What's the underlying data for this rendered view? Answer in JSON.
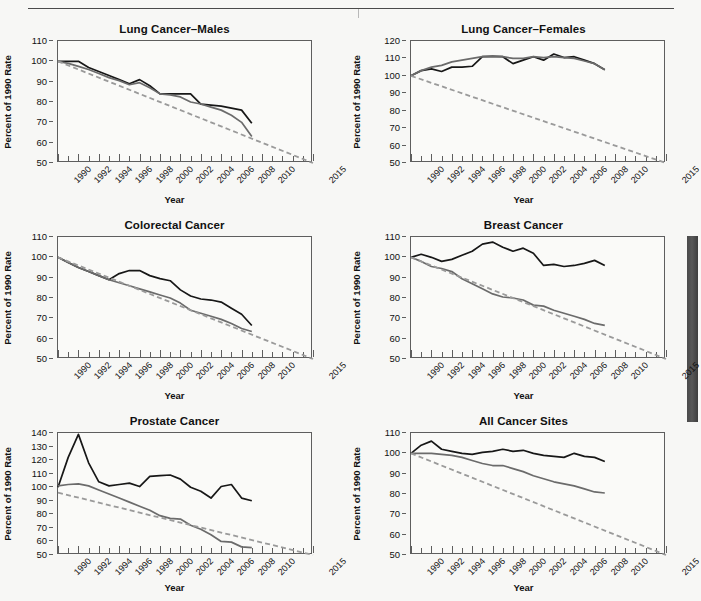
{
  "figure": {
    "axis_titles": {
      "x": "Year",
      "y": "Percent of 1990 Rate"
    },
    "xtick_labels": [
      "1990",
      "1992",
      "1994",
      "1996",
      "1998",
      "2000",
      "2002",
      "2004",
      "2006",
      "2008",
      "2010",
      "2015"
    ],
    "colors": {
      "observed_black": "#171717",
      "observed_gray": "#6b6b6b",
      "target_dashed": "#9a9a9a",
      "axis": "#5e5e5e",
      "page_background": "#f7f7f5"
    },
    "legend_note": ""
  },
  "chart_data": [
    {
      "type": "line",
      "title": "Lung Cancer–Males",
      "xlabel": "Year",
      "ylabel": "Percent of 1990 Rate",
      "xlim": [
        1990,
        2015
      ],
      "ylim": [
        50,
        110
      ],
      "yticks": [
        50,
        60,
        70,
        80,
        90,
        100,
        110
      ],
      "xticks": [
        1990,
        1992,
        1994,
        1996,
        1998,
        2000,
        2002,
        2004,
        2006,
        2008,
        2010,
        2015
      ],
      "grid": false,
      "legend_position": "none",
      "series": [
        {
          "name": "Incidence (black solid)",
          "x": [
            1990,
            1991,
            1992,
            1993,
            1994,
            1995,
            1996,
            1997,
            1998,
            1999,
            2000,
            2001,
            2002,
            2003,
            2004,
            2005,
            2006,
            2007,
            2008,
            2009
          ],
          "values": [
            100,
            100,
            100,
            97,
            95,
            93,
            91,
            89,
            91,
            88,
            84,
            84,
            84,
            84,
            79,
            78.5,
            78,
            77,
            76,
            69.5
          ]
        },
        {
          "name": "Mortality (gray solid)",
          "x": [
            1990,
            1991,
            1992,
            1993,
            1994,
            1995,
            1996,
            1997,
            1998,
            1999,
            2000,
            2001,
            2002,
            2003,
            2004,
            2005,
            2006,
            2007,
            2008,
            2009
          ],
          "values": [
            100,
            99,
            97.5,
            96,
            94,
            92,
            90.5,
            88.5,
            89.5,
            87,
            84,
            83.5,
            82.5,
            80,
            79,
            77.5,
            76,
            73.5,
            70,
            63
          ]
        },
        {
          "name": "Target trend (gray dashed)",
          "x": [
            1990,
            2015
          ],
          "values": [
            100,
            50
          ]
        }
      ]
    },
    {
      "type": "line",
      "title": "Lung Cancer–Females",
      "xlabel": "Year",
      "ylabel": "Percent of 1990 Rate",
      "xlim": [
        1990,
        2015
      ],
      "ylim": [
        50,
        120
      ],
      "yticks": [
        50,
        60,
        70,
        80,
        90,
        100,
        110,
        120
      ],
      "xticks": [
        1990,
        1992,
        1994,
        1996,
        1998,
        2000,
        2002,
        2004,
        2006,
        2008,
        2010,
        2015
      ],
      "grid": false,
      "legend_position": "none",
      "series": [
        {
          "name": "Incidence (black solid)",
          "x": [
            1990,
            1991,
            1992,
            1993,
            1994,
            1995,
            1996,
            1997,
            1998,
            1999,
            2000,
            2001,
            2002,
            2003,
            2004,
            2005,
            2006,
            2007,
            2008,
            2009
          ],
          "values": [
            100,
            103,
            104,
            102.5,
            105,
            105,
            105.5,
            111,
            111,
            111,
            107,
            109,
            111,
            109,
            112.5,
            110.5,
            111,
            109,
            107,
            103.5
          ]
        },
        {
          "name": "Mortality (gray solid)",
          "x": [
            1990,
            1991,
            1992,
            1993,
            1994,
            1995,
            1996,
            1997,
            1998,
            1999,
            2000,
            2001,
            2002,
            2003,
            2004,
            2005,
            2006,
            2007,
            2008,
            2009
          ],
          "values": [
            100,
            103,
            105,
            106,
            108,
            109,
            110,
            111,
            111.5,
            111,
            110,
            110,
            111,
            110.5,
            111,
            110.5,
            110,
            108.5,
            107,
            103.5
          ]
        },
        {
          "name": "Target trend (gray dashed)",
          "x": [
            1990,
            2015
          ],
          "values": [
            100,
            50
          ]
        }
      ]
    },
    {
      "type": "line",
      "title": "Colorectal Cancer",
      "xlabel": "Year",
      "ylabel": "Percent of 1990 Rate",
      "xlim": [
        1990,
        2015
      ],
      "ylim": [
        50,
        110
      ],
      "yticks": [
        50,
        60,
        70,
        80,
        90,
        100,
        110
      ],
      "xticks": [
        1990,
        1992,
        1994,
        1996,
        1998,
        2000,
        2002,
        2004,
        2006,
        2008,
        2010,
        2015
      ],
      "grid": false,
      "legend_position": "none",
      "series": [
        {
          "name": "Incidence (black solid)",
          "x": [
            1990,
            1991,
            1992,
            1993,
            1994,
            1995,
            1996,
            1997,
            1998,
            1999,
            2000,
            2001,
            2002,
            2003,
            2004,
            2005,
            2006,
            2007,
            2008,
            2009
          ],
          "values": [
            100,
            97.5,
            95,
            93,
            91,
            89,
            92,
            93.5,
            93.5,
            91,
            89.5,
            88.5,
            84,
            81,
            79.5,
            79,
            78,
            75,
            72,
            66.5
          ]
        },
        {
          "name": "Mortality (gray solid)",
          "x": [
            1990,
            1991,
            1992,
            1993,
            1994,
            1995,
            1996,
            1997,
            1998,
            1999,
            2000,
            2001,
            2002,
            2003,
            2004,
            2005,
            2006,
            2007,
            2008,
            2009
          ],
          "values": [
            100,
            97.5,
            95,
            93,
            91,
            89,
            87.5,
            86,
            84.5,
            83,
            81.5,
            80,
            77.5,
            74,
            72.5,
            71,
            69.5,
            67.5,
            65,
            63.5
          ]
        },
        {
          "name": "Target trend (gray dashed)",
          "x": [
            1990,
            2015
          ],
          "values": [
            100,
            50
          ]
        }
      ]
    },
    {
      "type": "line",
      "title": "Breast Cancer",
      "xlabel": "Year",
      "ylabel": "Percent of 1990 Rate",
      "xlim": [
        1990,
        2015
      ],
      "ylim": [
        50,
        110
      ],
      "yticks": [
        50,
        60,
        70,
        80,
        90,
        100,
        110
      ],
      "xticks": [
        1990,
        1992,
        1994,
        1996,
        1998,
        2000,
        2002,
        2004,
        2006,
        2008,
        2010,
        2015
      ],
      "grid": false,
      "legend_position": "none",
      "series": [
        {
          "name": "Incidence (black solid)",
          "x": [
            1990,
            1991,
            1992,
            1993,
            1994,
            1995,
            1996,
            1997,
            1998,
            1999,
            2000,
            2001,
            2002,
            2003,
            2004,
            2005,
            2006,
            2007,
            2008,
            2009
          ],
          "values": [
            100,
            101.5,
            100,
            98,
            99,
            101,
            103,
            106.5,
            107.5,
            105,
            103,
            104.5,
            102,
            96,
            96.5,
            95.5,
            96,
            97,
            98.5,
            96
          ]
        },
        {
          "name": "Mortality (gray solid)",
          "x": [
            1990,
            1991,
            1992,
            1993,
            1994,
            1995,
            1996,
            1997,
            1998,
            1999,
            2000,
            2001,
            2002,
            2003,
            2004,
            2005,
            2006,
            2007,
            2008,
            2009
          ],
          "values": [
            100,
            98,
            95.5,
            94.5,
            93,
            89.5,
            87,
            84.5,
            82,
            80.5,
            80,
            79,
            76.5,
            76,
            74,
            72.5,
            71,
            69.5,
            67.5,
            66.5
          ]
        },
        {
          "name": "Target trend (gray dashed)",
          "x": [
            1990,
            2015
          ],
          "values": [
            100,
            50
          ]
        }
      ]
    },
    {
      "type": "line",
      "title": "Prostate Cancer",
      "xlabel": "Year",
      "ylabel": "Percent of 1990 Rate",
      "xlim": [
        1990,
        2015
      ],
      "ylim": [
        50,
        140
      ],
      "yticks": [
        50,
        60,
        70,
        80,
        90,
        100,
        110,
        120,
        130,
        140
      ],
      "xticks": [
        1990,
        1992,
        1994,
        1996,
        1998,
        2000,
        2002,
        2004,
        2006,
        2008,
        2010,
        2015
      ],
      "grid": false,
      "legend_position": "none",
      "series": [
        {
          "name": "Incidence (black solid)",
          "x": [
            1990,
            1991,
            1992,
            1993,
            1994,
            1995,
            1996,
            1997,
            1998,
            1999,
            2000,
            2001,
            2002,
            2003,
            2004,
            2005,
            2006,
            2007,
            2008,
            2009
          ],
          "values": [
            100,
            122,
            139,
            118,
            104,
            101,
            102,
            103,
            100.5,
            108,
            108.5,
            109,
            106,
            100,
            97,
            92,
            100.5,
            102,
            92,
            90
          ]
        },
        {
          "name": "Mortality (gray solid)",
          "x": [
            1990,
            1991,
            1992,
            1993,
            1994,
            1995,
            1996,
            1997,
            1998,
            1999,
            2000,
            2001,
            2002,
            2003,
            2004,
            2005,
            2006,
            2007,
            2008,
            2009
          ],
          "values": [
            101,
            102,
            102.5,
            101,
            98,
            95,
            92,
            89,
            86,
            83,
            79,
            77,
            76.5,
            72,
            69,
            65,
            60,
            59.5,
            56,
            55.5
          ]
        },
        {
          "name": "Target trend (gray dashed)",
          "x": [
            1990,
            2015
          ],
          "values": [
            96,
            50
          ]
        }
      ]
    },
    {
      "type": "line",
      "title": "All Cancer Sites",
      "xlabel": "Year",
      "ylabel": "Percent of 1990 Rate",
      "xlim": [
        1990,
        2015
      ],
      "ylim": [
        50,
        110
      ],
      "yticks": [
        50,
        60,
        70,
        80,
        90,
        100,
        110
      ],
      "xticks": [
        1990,
        1992,
        1994,
        1996,
        1998,
        2000,
        2002,
        2004,
        2006,
        2008,
        2010,
        2015
      ],
      "grid": false,
      "legend_position": "none",
      "series": [
        {
          "name": "Incidence (black solid)",
          "x": [
            1990,
            1991,
            1992,
            1993,
            1994,
            1995,
            1996,
            1997,
            1998,
            1999,
            2000,
            2001,
            2002,
            2003,
            2004,
            2005,
            2006,
            2007,
            2008,
            2009
          ],
          "values": [
            100,
            104,
            106,
            102,
            101,
            100,
            99.5,
            100.5,
            101,
            102,
            101,
            101.5,
            100,
            99,
            98.5,
            98,
            100,
            98.5,
            98,
            96
          ]
        },
        {
          "name": "Mortality (gray solid)",
          "x": [
            1990,
            1991,
            1992,
            1993,
            1994,
            1995,
            1996,
            1997,
            1998,
            1999,
            2000,
            2001,
            2002,
            2003,
            2004,
            2005,
            2006,
            2007,
            2008,
            2009
          ],
          "values": [
            100,
            100,
            100,
            99.5,
            99,
            98,
            96.5,
            95,
            94,
            94,
            92.5,
            91,
            89,
            87.5,
            86,
            85,
            84,
            82.5,
            81,
            80.5
          ]
        },
        {
          "name": "Target trend (gray dashed)",
          "x": [
            1990,
            2015
          ],
          "values": [
            100,
            50
          ]
        }
      ]
    }
  ]
}
